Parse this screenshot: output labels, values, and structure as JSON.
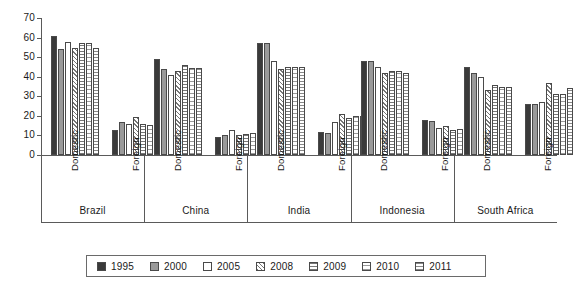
{
  "chart_data": {
    "type": "bar",
    "title": "",
    "subtitle": "",
    "xlabel": "",
    "ylabel": "",
    "ylim": [
      0,
      70
    ],
    "yticks": [
      0,
      10,
      20,
      30,
      40,
      50,
      60,
      70
    ],
    "grid": false,
    "legend_position": "bottom",
    "legend_entries": [
      "1995",
      "2000",
      "2005",
      "2008",
      "2009",
      "2010",
      "2011"
    ],
    "series_names": [
      "1995",
      "2000",
      "2005",
      "2008",
      "2009",
      "2010",
      "2011"
    ],
    "series_styles": [
      "solid-dark",
      "solid-gray",
      "white",
      "diagonal-hatch",
      "horizontal-hatch",
      "light-grid",
      "dotted-grid"
    ],
    "group_labels": [
      "Brazil",
      "China",
      "India",
      "Indonesia",
      "South Africa"
    ],
    "subgroup_labels": [
      "Domestic",
      "Foreign"
    ],
    "groups": [
      {
        "name": "Brazil",
        "subgroups": [
          {
            "name": "Domestic",
            "values": [
              61,
              54,
              58,
              54.5,
              57,
              57,
              54.5
            ]
          },
          {
            "name": "Foreign",
            "values": [
              13,
              17,
              16,
              19.5,
              16,
              15.5,
              18
            ]
          }
        ]
      },
      {
        "name": "China",
        "subgroups": [
          {
            "name": "Domestic",
            "values": [
              49,
              44,
              41,
              43,
              46,
              44.5,
              44.5
            ]
          },
          {
            "name": "Foreign",
            "values": [
              9,
              10,
              13,
              10,
              10.5,
              11,
              10.5
            ]
          }
        ]
      },
      {
        "name": "India",
        "subgroups": [
          {
            "name": "Domestic",
            "values": [
              57,
              57,
              48,
              44,
              45,
              45,
              45
            ]
          },
          {
            "name": "Foreign",
            "values": [
              12,
              11,
              17,
              21,
              19,
              20,
              20
            ]
          }
        ]
      },
      {
        "name": "Indonesia",
        "subgroups": [
          {
            "name": "Domestic",
            "values": [
              48,
              48,
              45,
              42,
              43,
              43,
              42
            ]
          },
          {
            "name": "Foreign",
            "values": [
              18,
              17.5,
              14,
              15,
              13,
              13.5,
              14
            ]
          }
        ]
      },
      {
        "name": "South Africa",
        "subgroups": [
          {
            "name": "Domestic",
            "values": [
              45,
              42,
              40,
              33,
              36,
              35,
              35
            ]
          },
          {
            "name": "Foreign",
            "values": [
              26,
              26,
              27,
              37,
              31,
              31,
              34
            ]
          }
        ]
      }
    ]
  },
  "colors": {
    "series_1995": "#3a3a3a",
    "series_2000": "#9a9a9a",
    "series_2005": "#ffffff",
    "axis": "#5a5a5a",
    "bar_outline": "#4a4a4a",
    "background": "#ffffff"
  }
}
